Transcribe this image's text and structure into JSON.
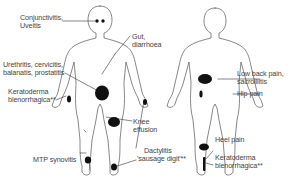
{
  "diagram": {
    "type": "anatomical-figure",
    "figures": [
      {
        "view": "front"
      },
      {
        "view": "back"
      }
    ],
    "colors": {
      "outline": "#555555",
      "marker": "#111111",
      "text": "#444444",
      "background": "#ffffff"
    },
    "labels": {
      "eyes": [
        "Conjunctivitis,",
        "Uveitis"
      ],
      "gut": [
        "Gut,",
        "diarrhoea"
      ],
      "genital": [
        "Urethritis, cervicitis,",
        "balanatis, prostatitis"
      ],
      "hand_skin": [
        "Keratoderma",
        "blenorrhagica**"
      ],
      "knee": [
        "Knee",
        "effusion"
      ],
      "dactylitis": [
        "Dactylitis",
        "'sausage digit'**"
      ],
      "mtp": [
        "MTP synovitis"
      ],
      "low_back": [
        "Low back pain,",
        "sacroiliitis"
      ],
      "hip": [
        "Hip pain"
      ],
      "heel": [
        "Heel pain"
      ],
      "foot_skin": [
        "Keratoderma",
        "blenorrhagica**"
      ]
    }
  }
}
